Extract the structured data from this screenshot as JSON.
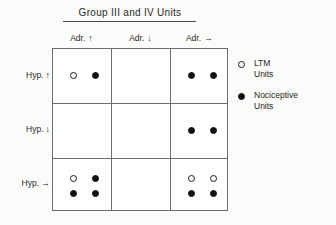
{
  "figure": {
    "title": "Group III and IV Units",
    "background_color": "#fbfbf9",
    "line_color": "#6d6d6d",
    "marker_color": "#111111"
  },
  "chart_data": {
    "type": "table",
    "title": "Group III and IV Units",
    "xlabel": "",
    "ylabel": "",
    "grid": true,
    "legend_position": "right",
    "columns": [
      {
        "label": "Adr.",
        "arrow": "↑",
        "arrow_name": "up-arrow"
      },
      {
        "label": "Adr.",
        "arrow": "↓",
        "arrow_name": "down-arrow"
      },
      {
        "label": "Adr.",
        "arrow": "→",
        "arrow_name": "right-arrow"
      }
    ],
    "rows": [
      {
        "label": "Hyp.",
        "arrow": "↑",
        "arrow_name": "up-arrow"
      },
      {
        "label": "Hyp.",
        "arrow": "↓",
        "arrow_name": "down-arrow"
      },
      {
        "label": "Hyp.",
        "arrow": "→",
        "arrow_name": "right-arrow"
      }
    ],
    "legend": [
      {
        "marker": "open",
        "line1": "LTM",
        "line2": "Units"
      },
      {
        "marker": "filled",
        "line1": "Nociceptive",
        "line2": "Units"
      }
    ],
    "cells": [
      [
        {
          "markers": [
            [
              "open",
              "filled"
            ],
            [
              null,
              null
            ]
          ],
          "open_count": 1,
          "filled_count": 1,
          "total": 2
        },
        {
          "markers": [
            [
              null,
              null
            ],
            [
              null,
              null
            ]
          ],
          "open_count": 0,
          "filled_count": 0,
          "total": 0
        },
        {
          "markers": [
            [
              "filled",
              "filled"
            ],
            [
              null,
              null
            ]
          ],
          "open_count": 0,
          "filled_count": 2,
          "total": 2
        }
      ],
      [
        {
          "markers": [
            [
              null,
              null
            ],
            [
              null,
              null
            ]
          ],
          "open_count": 0,
          "filled_count": 0,
          "total": 0
        },
        {
          "markers": [
            [
              null,
              null
            ],
            [
              null,
              null
            ]
          ],
          "open_count": 0,
          "filled_count": 0,
          "total": 0
        },
        {
          "markers": [
            [
              "filled",
              "filled"
            ],
            [
              null,
              null
            ]
          ],
          "open_count": 0,
          "filled_count": 2,
          "total": 2
        }
      ],
      [
        {
          "markers": [
            [
              "open",
              "filled"
            ],
            [
              "filled",
              "filled"
            ]
          ],
          "open_count": 1,
          "filled_count": 3,
          "total": 4
        },
        {
          "markers": [
            [
              null,
              null
            ],
            [
              null,
              null
            ]
          ],
          "open_count": 0,
          "filled_count": 0,
          "total": 0
        },
        {
          "markers": [
            [
              "open",
              "open"
            ],
            [
              "filled",
              "filled"
            ]
          ],
          "open_count": 2,
          "filled_count": 2,
          "total": 4
        }
      ]
    ]
  }
}
